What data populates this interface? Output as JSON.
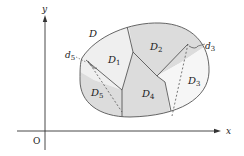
{
  "diagram": {
    "axes": {
      "x_label": "x",
      "y_label": "y",
      "origin_label": "O"
    },
    "region": {
      "outer_label": "D",
      "subregions": [
        {
          "name": "D",
          "sub": "1",
          "fill": "#efefef"
        },
        {
          "name": "D",
          "sub": "2",
          "fill": "#dcdcdc"
        },
        {
          "name": "D",
          "sub": "3",
          "fill": "#f6f6f6"
        },
        {
          "name": "D",
          "sub": "4",
          "fill": "#dcdcdc"
        },
        {
          "name": "D",
          "sub": "5",
          "fill": "#dcdcdc"
        }
      ],
      "diameters": [
        {
          "name": "d",
          "sub": "3"
        },
        {
          "name": "d",
          "sub": "5"
        }
      ]
    },
    "colors": {
      "stroke": "#444444",
      "axis": "#333333",
      "light_fill": "#efefef",
      "dark_fill": "#dcdcdc"
    }
  }
}
